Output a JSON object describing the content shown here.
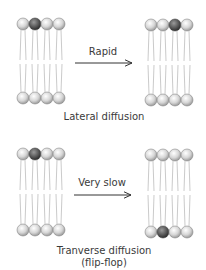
{
  "panels": [
    {
      "id": "lateral",
      "arrow_label": "Rapid",
      "caption_lines": [
        "Lateral diffusion"
      ],
      "before": {
        "top_dark_index": 1,
        "bottom_dark_index": null
      },
      "after": {
        "top_dark_index": 2,
        "bottom_dark_index": null
      }
    },
    {
      "id": "transverse",
      "arrow_label": "Very slow",
      "caption_lines": [
        "Tranverse diffusion",
        "(flip-flop)"
      ],
      "before": {
        "top_dark_index": 1,
        "bottom_dark_index": null
      },
      "after": {
        "top_dark_index": null,
        "bottom_dark_index": 1
      }
    }
  ],
  "colors": {
    "head_light": "#d9d9d9",
    "head_dark": "#555555",
    "tail": "#b8b8b8",
    "arrow": "#333333"
  }
}
